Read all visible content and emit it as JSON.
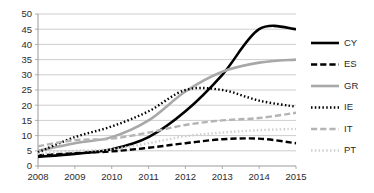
{
  "chart_data": {
    "type": "line",
    "title": "",
    "subtitle": "",
    "xlabel": "",
    "ylabel": "",
    "x": [
      2008,
      2009,
      2010,
      2011,
      2012,
      2013,
      2014,
      2015
    ],
    "categories": [
      "2008",
      "2009",
      "2010",
      "2011",
      "2012",
      "2013",
      "2014",
      "2015"
    ],
    "xlim": [
      2008,
      2015
    ],
    "ylim": [
      0,
      50
    ],
    "yticks": [
      0,
      5,
      10,
      15,
      20,
      25,
      30,
      35,
      40,
      45,
      50
    ],
    "xticks": [
      "2008",
      "2009",
      "2010",
      "2011",
      "2012",
      "2013",
      "2014",
      "2015"
    ],
    "grid": "horizontal",
    "legend_position": "right",
    "series": [
      {
        "name": "CY",
        "label": "CY",
        "color": "#000000",
        "dash": "none",
        "width": 2.6,
        "values": [
          3.0,
          4.0,
          5.5,
          9.5,
          18.0,
          30.0,
          45.0,
          45.0
        ]
      },
      {
        "name": "ES",
        "label": "ES",
        "color": "#000000",
        "dash": "dashed",
        "width": 2.4,
        "values": [
          3.5,
          4.2,
          4.8,
          6.0,
          7.5,
          8.8,
          9.0,
          7.5
        ]
      },
      {
        "name": "GR",
        "label": "GR",
        "color": "#a8a8a8",
        "dash": "none",
        "width": 2.6,
        "values": [
          5.0,
          7.5,
          9.5,
          15.0,
          24.5,
          31.0,
          34.0,
          35.0
        ]
      },
      {
        "name": "IE",
        "label": "IE",
        "color": "#000000",
        "dash": "dotted",
        "width": 2.4,
        "values": [
          4.5,
          9.5,
          13.0,
          18.0,
          25.0,
          25.0,
          21.5,
          19.5
        ]
      },
      {
        "name": "IT",
        "label": "IT",
        "color": "#b4b4b4",
        "dash": "dashed",
        "width": 2.4,
        "values": [
          6.5,
          8.5,
          9.0,
          11.0,
          13.5,
          15.0,
          15.8,
          17.5
        ]
      },
      {
        "name": "PT",
        "label": "PT",
        "color": "#cfcfcf",
        "dash": "dotted",
        "width": 2.4,
        "values": [
          4.0,
          5.0,
          5.5,
          7.5,
          9.8,
          11.0,
          11.8,
          12.2
        ]
      }
    ]
  }
}
